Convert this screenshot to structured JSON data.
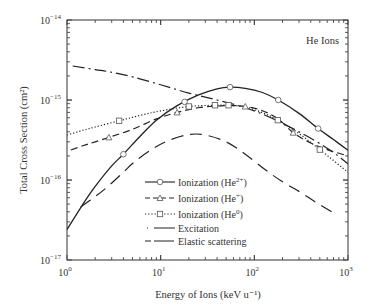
{
  "chart_data": {
    "type": "line",
    "title": "",
    "annotation": "He Ions",
    "xlabel": "Energy of Ions (keV u⁻¹)",
    "ylabel": "Total Cross Section (cm²)",
    "xscale": "log",
    "yscale": "log",
    "xlim": [
      1,
      1000
    ],
    "ylim": [
      1e-17,
      1e-14
    ],
    "x_ticks": [
      {
        "base": "10",
        "exp": "0"
      },
      {
        "base": "10",
        "exp": "1"
      },
      {
        "base": "10",
        "exp": "2"
      },
      {
        "base": "10",
        "exp": "3"
      }
    ],
    "y_ticks": [
      {
        "base": "10",
        "exp": "−17"
      },
      {
        "base": "10",
        "exp": "−16"
      },
      {
        "base": "10",
        "exp": "−15"
      },
      {
        "base": "10",
        "exp": "−14"
      }
    ],
    "grid": false,
    "legend_position": "lower-center",
    "series": [
      {
        "name": "Ionization (He²⁺)",
        "label_main": "Ionization (He",
        "label_sup": "2+",
        "style": "solid",
        "marker": "circle",
        "x": [
          1,
          1.5,
          2,
          3,
          4,
          6,
          9,
          15,
          25,
          40,
          55,
          80,
          120,
          180,
          300,
          480,
          700,
          1000
        ],
        "y": [
          2.4e-17,
          5.1e-17,
          8.3e-17,
          1.5e-16,
          2.1e-16,
          3.5e-16,
          5.6e-16,
          8.5e-16,
          1.15e-15,
          1.38e-15,
          1.45e-15,
          1.4e-15,
          1.25e-15,
          1e-15,
          6.8e-16,
          4.4e-16,
          3.2e-16,
          2.35e-16
        ],
        "marker_x": [
          4,
          18,
          55,
          180,
          480
        ]
      },
      {
        "name": "Ionization (He⁺)",
        "label_main": "Ionization (He",
        "label_sup": "+",
        "style": "dashed",
        "marker": "triangle",
        "x": [
          1.1,
          1.5,
          2,
          3,
          5,
          9,
          15,
          25,
          40,
          60,
          80,
          120,
          180,
          260,
          400,
          600,
          1000
        ],
        "y": [
          2.37e-16,
          2.7e-16,
          3e-16,
          3.5e-16,
          4.3e-16,
          5.8e-16,
          7e-16,
          8e-16,
          8.4e-16,
          8.5e-16,
          8.3e-16,
          7.4e-16,
          5.8e-16,
          3.9e-16,
          2.9e-16,
          2.4e-16,
          2e-16
        ],
        "marker_x": [
          2.8,
          15,
          80,
          260
        ]
      },
      {
        "name": "Ionization (He⁰)",
        "label_main": "Ionization (He",
        "label_sup": "0",
        "style": "dotted",
        "marker": "square",
        "x": [
          1,
          1.5,
          2,
          3.6,
          6,
          10,
          20,
          38,
          53,
          80,
          120,
          178,
          300,
          500,
          1000
        ],
        "y": [
          3.65e-16,
          4.2e-16,
          4.6e-16,
          5.5e-16,
          6.4e-16,
          7.3e-16,
          8.3e-16,
          8.6e-16,
          8.6e-16,
          8.2e-16,
          7e-16,
          5.6e-16,
          3.8e-16,
          2.4e-16,
          1.25e-16
        ],
        "marker_x": [
          3.6,
          20,
          38,
          53,
          178,
          500
        ]
      },
      {
        "name": "Excitation",
        "label_main": "Excitation",
        "label_sup": "",
        "style": "longdash",
        "marker": "none",
        "x": [
          1.4,
          2,
          2.7,
          4,
          5.2,
          8,
          12,
          20,
          30,
          50,
          80,
          130,
          200,
          306,
          450,
          670
        ],
        "y": [
          4.6e-17,
          6.2e-17,
          8.2e-17,
          1.25e-16,
          1.67e-16,
          2.4e-16,
          3.1e-16,
          3.7e-16,
          3.65e-16,
          3e-16,
          2.1e-16,
          1.35e-16,
          9.5e-17,
          7.1e-17,
          5.3e-17,
          4e-17
        ],
        "marker_x": []
      },
      {
        "name": "Elastic scattering",
        "label_main": "Elastic scattering",
        "label_sup": "",
        "style": "dashdot",
        "marker": "none",
        "x": [
          1.15,
          2,
          2.9,
          5,
          10,
          20,
          40,
          80,
          150,
          300,
          600,
          1000
        ],
        "y": [
          2.66e-15,
          2.4e-15,
          2.24e-15,
          1.95e-15,
          1.55e-15,
          1.22e-15,
          1e-15,
          8e-16,
          6e-16,
          4e-16,
          2.5e-16,
          1.6e-16
        ],
        "marker_x": []
      }
    ]
  }
}
